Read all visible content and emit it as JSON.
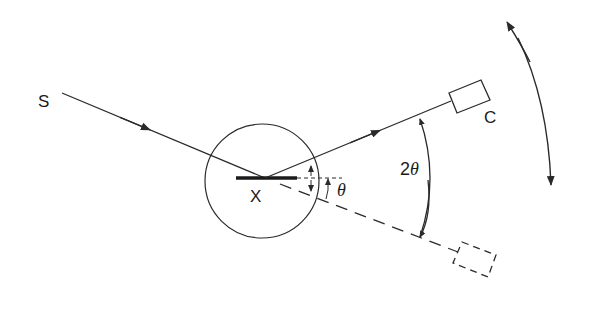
{
  "diagram": {
    "type": "x-ray-diffraction-geometry",
    "labels": {
      "source": "S",
      "crystal": "X",
      "counter": "C",
      "theta": "θ",
      "two_theta_prefix": "2",
      "two_theta_symbol": "θ"
    },
    "elements": {
      "incident_beam": "S → X",
      "reflected_beam": "X → C",
      "undeviated_beam": "dashed extension to counter's alternate position",
      "crystal_holder": "circle around X",
      "rotation_arrow": "double-headed arc indicating counter rotation"
    },
    "colors": {
      "line": "#2a2a2a",
      "background": "#ffffff"
    }
  }
}
